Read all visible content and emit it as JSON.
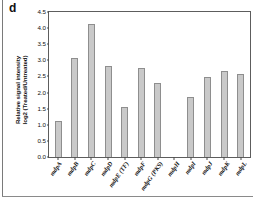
{
  "panel": {
    "letter": "d"
  },
  "axes": {
    "y_title_line1": "Relative signal intensity",
    "y_title_line2": "log2 (Treated/Untreated)",
    "y_ticks": [
      "0.0",
      "0.5",
      "1.0",
      "1.5",
      "2.0",
      "2.5",
      "3.0",
      "3.5",
      "4.0",
      "4.5"
    ]
  },
  "chart_data": {
    "type": "bar",
    "title": "",
    "xlabel": "",
    "ylabel": "Relative signal intensity log2 (Treated/Untreated)",
    "ylim": [
      0,
      4.5
    ],
    "ytick_step": 0.5,
    "grid": false,
    "legend": "none",
    "bar_color": "#c9c9c9",
    "bar_edge_color": "#8e8e8e",
    "categories": [
      "mdpA",
      "mdpB",
      "mdpC",
      "mdpD",
      "mdpE (TF)",
      "mdpF",
      "mdpG (PKS)",
      "mdpH",
      "mdpI",
      "mdpJ",
      "mdpK",
      "mdpL"
    ],
    "values": [
      1.12,
      3.08,
      4.12,
      2.81,
      1.54,
      2.77,
      2.3,
      0.0,
      1.85,
      2.48,
      2.68,
      2.58
    ]
  }
}
